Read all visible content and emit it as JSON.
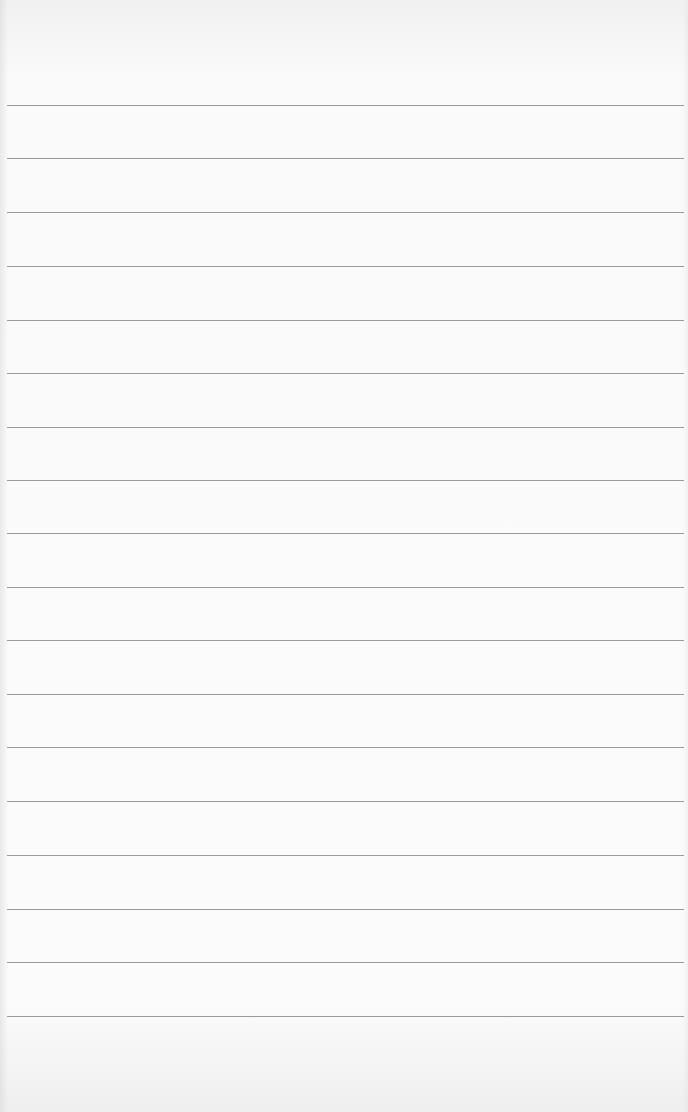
{
  "page": {
    "type": "ruled-paper",
    "background_color": "#f7f7f6",
    "rule_color": "#8a8a8a",
    "rules_y": [
      105,
      158,
      212,
      266,
      320,
      373,
      427,
      480,
      533,
      587,
      640,
      694,
      747,
      801,
      855,
      909,
      962,
      1016
    ]
  }
}
